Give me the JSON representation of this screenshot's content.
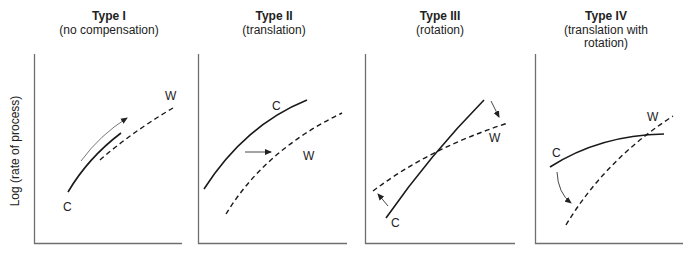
{
  "figure": {
    "y_axis_label": "Log (rate of process)",
    "panels": [
      {
        "title": "Type I",
        "subtitle_lines": [
          "(no compensation)"
        ],
        "curve_labels": {
          "C": "C",
          "W": "W"
        },
        "arrow_meaning": "shift along the curve"
      },
      {
        "title": "Type II",
        "subtitle_lines": [
          "(translation)"
        ],
        "curve_labels": {
          "C": "C",
          "W": "W"
        },
        "arrow_meaning": "horizontal shift"
      },
      {
        "title": "Type III",
        "subtitle_lines": [
          "(rotation)"
        ],
        "curve_labels": {
          "C": "C",
          "W": "W"
        },
        "arrow_meaning": "rotation about crossing point"
      },
      {
        "title": "Type IV",
        "subtitle_lines": [
          "(translation with",
          "rotation)"
        ],
        "curve_labels": {
          "C": "C",
          "W": "W"
        },
        "arrow_meaning": "translation combined with rotation"
      }
    ],
    "legend": {
      "solid_line": "C",
      "dashed_line": "W"
    },
    "colors": {
      "axis": "#6f6f6f",
      "curve": "#1a1a1a",
      "text": "#222222",
      "background": "#ffffff"
    }
  }
}
